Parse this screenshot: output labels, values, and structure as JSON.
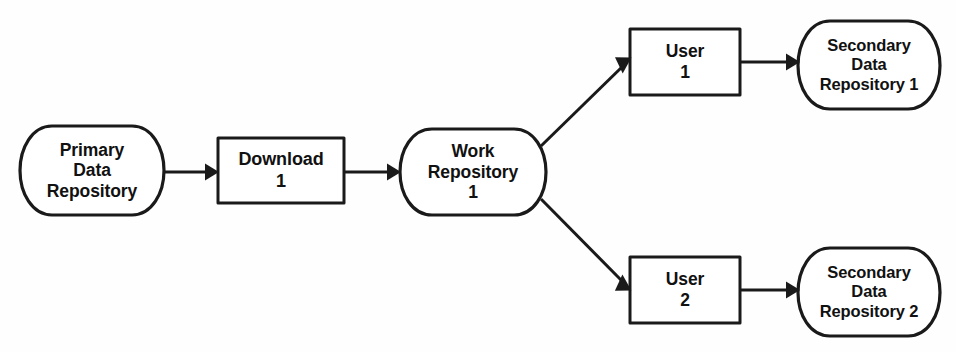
{
  "figure": {
    "type": "flow-diagram",
    "background_color": "#ffffff",
    "line_color": "#1a1a1a",
    "text_color": "#111111",
    "caption": ""
  },
  "nodes": {
    "primary_repository": {
      "shape": "cylinder",
      "lines": [
        "Primary",
        "Data",
        "Repository"
      ]
    },
    "download": {
      "shape": "rectangle",
      "lines": [
        "Download",
        "1"
      ]
    },
    "work_repository": {
      "shape": "cylinder",
      "lines": [
        "Work",
        "Repository",
        "1"
      ]
    },
    "user_1": {
      "shape": "rectangle",
      "lines": [
        "User",
        "1"
      ]
    },
    "user_2": {
      "shape": "rectangle",
      "lines": [
        "User",
        "2"
      ]
    },
    "secondary_repository_1": {
      "shape": "cylinder",
      "lines": [
        "Secondary",
        "Data",
        "Repository 1"
      ]
    },
    "secondary_repository_2": {
      "shape": "cylinder",
      "lines": [
        "Secondary",
        "Data",
        "Repository 2"
      ]
    }
  },
  "edges": [
    {
      "id": "primary-to-download",
      "from": "primary_repository",
      "to": "download",
      "style": "straight-arrow"
    },
    {
      "id": "download-to-work",
      "from": "download",
      "to": "work_repository",
      "style": "straight-arrow"
    },
    {
      "id": "work-to-user1",
      "from": "work_repository",
      "to": "user_1",
      "style": "diagonal-arrow"
    },
    {
      "id": "work-to-user2",
      "from": "work_repository",
      "to": "user_2",
      "style": "diagonal-arrow"
    },
    {
      "id": "user1-to-secondary1",
      "from": "user_1",
      "to": "secondary_repository_1",
      "style": "straight-arrow"
    },
    {
      "id": "user2-to-secondary2",
      "from": "user_2",
      "to": "secondary_repository_2",
      "style": "straight-arrow"
    }
  ]
}
